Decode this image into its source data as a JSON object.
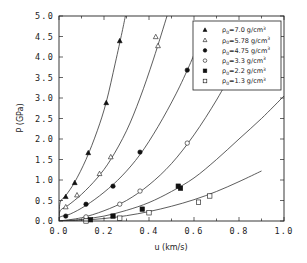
{
  "chart_data": {
    "type": "scatter",
    "title": "",
    "xlabel": "u (km/s)",
    "ylabel": "P (GPa)",
    "xlim": [
      0.0,
      1.0
    ],
    "ylim": [
      0.0,
      5.0
    ],
    "xticks": [
      "0.0",
      "0.2",
      "0.4",
      "0.6",
      "0.8",
      "1.0"
    ],
    "yticks": [
      "0.0",
      "0.5",
      "1.0",
      "1.5",
      "2.0",
      "2.5",
      "3.0",
      "3.5",
      "4.0",
      "4.5",
      "5.0"
    ],
    "grid": false,
    "legend_position": "upper right",
    "series": [
      {
        "name": "ρ0=7.0 g/cm³",
        "label_main": "ρ",
        "label_sub": "0",
        "label_rest": "=7.0  g/cm",
        "label_sup": "3",
        "marker": "filled-triangle",
        "points": [
          [
            0.03,
            0.59
          ],
          [
            0.07,
            0.93
          ],
          [
            0.13,
            1.66
          ],
          [
            0.21,
            2.88
          ],
          [
            0.27,
            4.39
          ]
        ],
        "curve": [
          [
            0.0,
            0.0
          ],
          [
            0.005,
            0.45
          ],
          [
            0.03,
            0.62
          ],
          [
            0.07,
            0.95
          ],
          [
            0.12,
            1.5
          ],
          [
            0.17,
            2.2
          ],
          [
            0.21,
            2.9
          ],
          [
            0.25,
            3.85
          ],
          [
            0.28,
            4.6
          ],
          [
            0.295,
            5.0
          ]
        ]
      },
      {
        "name": "ρ0=5.78 g/cm³",
        "label_main": "ρ",
        "label_sub": "0",
        "label_rest": "=5.78  g/cm",
        "label_sup": "3",
        "marker": "open-triangle",
        "points": [
          [
            0.03,
            0.34
          ],
          [
            0.08,
            0.63
          ],
          [
            0.18,
            1.15
          ],
          [
            0.23,
            1.56
          ],
          [
            0.43,
            4.49
          ],
          [
            0.44,
            4.27
          ]
        ],
        "curve": [
          [
            0.0,
            0.0
          ],
          [
            0.005,
            0.25
          ],
          [
            0.04,
            0.38
          ],
          [
            0.1,
            0.65
          ],
          [
            0.17,
            1.05
          ],
          [
            0.23,
            1.5
          ],
          [
            0.3,
            2.2
          ],
          [
            0.36,
            3.0
          ],
          [
            0.42,
            3.95
          ],
          [
            0.48,
            5.0
          ]
        ]
      },
      {
        "name": "ρ0=4.75 g/cm³",
        "label_main": "ρ",
        "label_sub": "0",
        "label_rest": "=4.75  g/cm",
        "label_sup": "3",
        "marker": "filled-circle",
        "points": [
          [
            0.03,
            0.12
          ],
          [
            0.12,
            0.41
          ],
          [
            0.24,
            0.85
          ],
          [
            0.36,
            1.68
          ],
          [
            0.57,
            3.68
          ]
        ],
        "curve": [
          [
            0.0,
            0.0
          ],
          [
            0.005,
            0.1
          ],
          [
            0.05,
            0.17
          ],
          [
            0.12,
            0.38
          ],
          [
            0.2,
            0.7
          ],
          [
            0.28,
            1.1
          ],
          [
            0.36,
            1.62
          ],
          [
            0.44,
            2.3
          ],
          [
            0.52,
            3.1
          ],
          [
            0.58,
            3.8
          ],
          [
            0.61,
            4.2
          ]
        ]
      },
      {
        "name": "ρ0=3.3 g/cm³",
        "label_main": "ρ",
        "label_sub": "0",
        "label_rest": "=3.3  g/cm",
        "label_sup": "3",
        "marker": "open-circle",
        "points": [
          [
            0.12,
            0.1
          ],
          [
            0.27,
            0.41
          ],
          [
            0.36,
            0.73
          ],
          [
            0.57,
            1.9
          ]
        ],
        "curve": [
          [
            0.0,
            0.0
          ],
          [
            0.1,
            0.08
          ],
          [
            0.2,
            0.25
          ],
          [
            0.3,
            0.5
          ],
          [
            0.4,
            0.88
          ],
          [
            0.5,
            1.4
          ],
          [
            0.6,
            2.1
          ],
          [
            0.7,
            2.95
          ],
          [
            0.78,
            3.75
          ],
          [
            0.81,
            4.1
          ]
        ]
      },
      {
        "name": "ρ0=2.2 g/cm³",
        "label_main": "ρ",
        "label_sub": "0",
        "label_rest": "=2.2  g/cm",
        "label_sup": "3",
        "marker": "filled-square",
        "points": [
          [
            0.14,
            0.03
          ],
          [
            0.24,
            0.12
          ],
          [
            0.37,
            0.29
          ],
          [
            0.53,
            0.85
          ],
          [
            0.54,
            0.8
          ]
        ],
        "curve": [
          [
            0.0,
            0.0
          ],
          [
            0.1,
            0.04
          ],
          [
            0.2,
            0.12
          ],
          [
            0.3,
            0.26
          ],
          [
            0.4,
            0.45
          ],
          [
            0.5,
            0.72
          ],
          [
            0.6,
            1.05
          ],
          [
            0.7,
            1.5
          ],
          [
            0.8,
            2.0
          ],
          [
            0.9,
            2.5
          ],
          [
            1.0,
            3.05
          ]
        ]
      },
      {
        "name": "ρ0=1.3 g/cm³",
        "label_main": "ρ",
        "label_sub": "0",
        "label_rest": "=1.3  g/cm",
        "label_sup": "3",
        "marker": "open-square",
        "points": [
          [
            0.12,
            0.0
          ],
          [
            0.27,
            0.07
          ],
          [
            0.4,
            0.2
          ],
          [
            0.62,
            0.46
          ],
          [
            0.67,
            0.61
          ]
        ],
        "curve": [
          [
            0.0,
            0.0
          ],
          [
            0.1,
            0.02
          ],
          [
            0.2,
            0.06
          ],
          [
            0.3,
            0.13
          ],
          [
            0.4,
            0.23
          ],
          [
            0.5,
            0.36
          ],
          [
            0.6,
            0.52
          ],
          [
            0.7,
            0.72
          ],
          [
            0.8,
            0.96
          ],
          [
            0.9,
            1.22
          ]
        ]
      }
    ]
  }
}
